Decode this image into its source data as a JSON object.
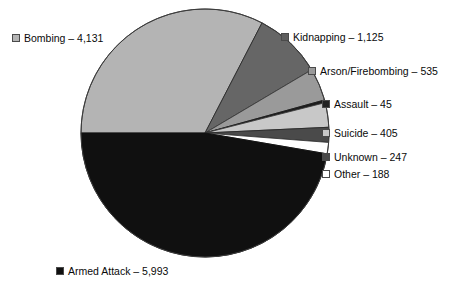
{
  "chart_data": {
    "type": "pie",
    "title": "",
    "subtitle": "",
    "xlabel": "",
    "ylabel": "",
    "legend_position": "callout-labels",
    "grid": false,
    "total": 12669,
    "start_angle_deg": 180,
    "direction": "clockwise",
    "categories": [
      "Bombing",
      "Kidnapping",
      "Arson/Firebombing",
      "Assault",
      "Suicide",
      "Unknown",
      "Other",
      "Armed Attack"
    ],
    "values": [
      4131,
      1125,
      535,
      45,
      405,
      247,
      188,
      5993
    ],
    "value_labels": [
      "4,131",
      "1,125",
      "535",
      "45",
      "405",
      "247",
      "188",
      "5,993"
    ],
    "slices": [
      {
        "name": "Bombing",
        "value": 4131,
        "value_label": "4,131",
        "label": "Bombing – 4,131",
        "color": "#b4b4b4",
        "stroke": "#3c3c3c",
        "swatch": "#b4b4b4"
      },
      {
        "name": "Kidnapping",
        "value": 1125,
        "value_label": "1,125",
        "label": "Kidnapping – 1,125",
        "color": "#666666",
        "stroke": "#2a2a2a",
        "swatch": "#5e5e5e"
      },
      {
        "name": "Arson/Firebombing",
        "value": 535,
        "value_label": "535",
        "label": "Arson/Firebombing – 535",
        "color": "#9a9a9a",
        "stroke": "#3c3c3c",
        "swatch": "#9a9a9a"
      },
      {
        "name": "Assault",
        "value": 45,
        "value_label": "45",
        "label": "Assault – 45",
        "color": "#1c1c1c",
        "stroke": "#1c1c1c",
        "swatch": "#222222"
      },
      {
        "name": "Suicide",
        "value": 405,
        "value_label": "405",
        "label": "Suicide – 405",
        "color": "#c8c8c8",
        "stroke": "#3c3c3c",
        "swatch": "#c8c8c8"
      },
      {
        "name": "Unknown",
        "value": 247,
        "value_label": "247",
        "label": "Unknown – 247",
        "color": "#4a4a4a",
        "stroke": "#2a2a2a",
        "swatch": "#4a4a4a"
      },
      {
        "name": "Other",
        "value": 188,
        "value_label": "188",
        "label": "Other – 188",
        "color": "#ffffff",
        "stroke": "#3c3c3c",
        "swatch": "#ffffff"
      },
      {
        "name": "Armed Attack",
        "value": 5993,
        "value_label": "5,993",
        "label": "Armed Attack – 5,993",
        "color": "#101010",
        "stroke": "#101010",
        "swatch": "#101010"
      }
    ]
  },
  "labels": {
    "bombing": "Bombing – 4,131",
    "kidnapping": "Kidnapping – 1,125",
    "arson": "Arson/Firebombing – 535",
    "assault": "Assault – 45",
    "suicide": "Suicide – 405",
    "unknown": "Unknown – 247",
    "other": "Other – 188",
    "armed_attack": "Armed Attack – 5,993"
  },
  "geometry": {
    "center_x": 205,
    "center_y": 133,
    "radius": 124
  },
  "colors": {
    "background": "#ffffff",
    "text": "#0a0a0a",
    "outline": "#3c3c3c"
  }
}
